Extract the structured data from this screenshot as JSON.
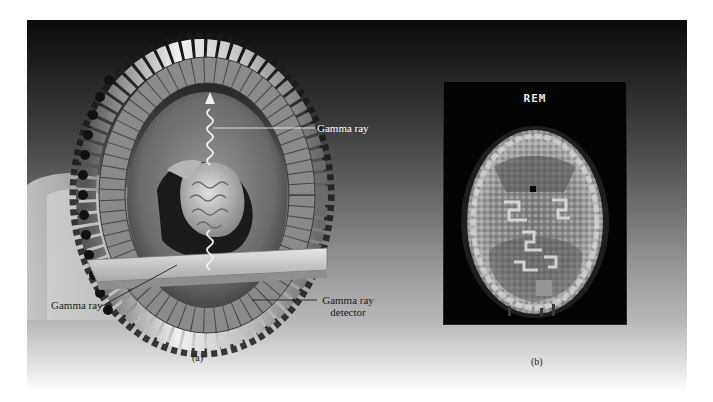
{
  "figure": {
    "panel_a": {
      "caption": "(a)",
      "labels": {
        "gamma_ray_top": "Gamma ray",
        "gamma_ray_bottom": "Gamma ray",
        "detector_line1": "Gamma ray",
        "detector_line2": "detector"
      },
      "subject": "patient lying on table inside ring of detectors, brain visible, gamma ray wave arrow emitted upward and downward"
    },
    "panel_b": {
      "caption": "(b)",
      "scan_title": "REM",
      "subject": "PET brain scan, axial slice, grayscale"
    },
    "colors": {
      "panel_top": "#0b0b0b",
      "panel_mid": "#6d6d6d",
      "panel_bottom": "#ffffff",
      "scan_background": "#030303",
      "label_text_light": "#ffffff",
      "label_text_dark": "#1c1c1c"
    }
  }
}
